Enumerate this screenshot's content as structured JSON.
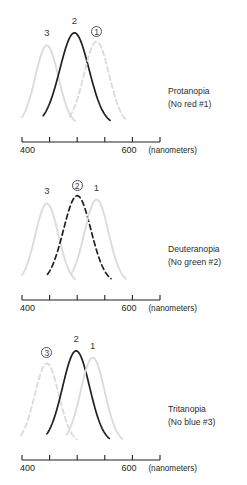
{
  "figure": {
    "background": "#ffffff",
    "dark_color": "#231f20",
    "light_color": "#dcdcdc",
    "mid_color": "#d2d2d2"
  },
  "axis": {
    "label_left": "400",
    "label_right": "600",
    "unit": "(nanometers)",
    "tick_count": 6,
    "x_min_nm": 400,
    "x_max_nm": 650,
    "tick_values_nm": [
      400,
      450,
      500,
      550,
      600,
      650
    ]
  },
  "panels": [
    {
      "id": "protanopia",
      "caption_line1": "Protanopia",
      "caption_line2": "(No red #1)",
      "labels": [
        {
          "text": "3",
          "circled": false
        },
        {
          "text": "2",
          "circled": false
        },
        {
          "text": "1",
          "circled": true
        }
      ]
    },
    {
      "id": "deuteranopia",
      "caption_line1": "Deuteranopia",
      "caption_line2": "(No green #2)",
      "labels": [
        {
          "text": "3",
          "circled": false
        },
        {
          "text": "2",
          "circled": true
        },
        {
          "text": "1",
          "circled": false
        }
      ]
    },
    {
      "id": "tritanopia",
      "caption_line1": "Tritanopia",
      "caption_line2": "(No blue #3)",
      "labels": [
        {
          "text": "3",
          "circled": true
        },
        {
          "text": "2",
          "circled": false
        },
        {
          "text": "1",
          "circled": false
        }
      ]
    }
  ],
  "chart_data": {
    "type": "line",
    "xlabel": "(nanometers)",
    "ylabel": "",
    "xlim": [
      400,
      650
    ],
    "xticks": [
      400,
      450,
      500,
      550,
      600,
      650
    ],
    "xticklabels": [
      "400",
      "",
      "",
      "",
      "600",
      ""
    ],
    "grid": false,
    "legend": "inline curve numbers above peaks",
    "panels": [
      {
        "name": "Protanopia",
        "annotation": "(No red #1)",
        "missing_cone": 1,
        "series": [
          {
            "name": "3",
            "peak_nm": 445,
            "peak_height": 0.82,
            "width_nm": 46,
            "style": "solid",
            "color": "#dcdcdc",
            "emphasis": "faint"
          },
          {
            "name": "2",
            "peak_nm": 495,
            "peak_height": 0.95,
            "width_nm": 58,
            "style": "solid",
            "color": "#231f20",
            "emphasis": "strong"
          },
          {
            "name": "1",
            "peak_nm": 535,
            "peak_height": 0.86,
            "width_nm": 50,
            "style": "dashed",
            "color": "#dcdcdc",
            "emphasis": "faint"
          }
        ]
      },
      {
        "name": "Deuteranopia",
        "annotation": "(No green #2)",
        "missing_cone": 2,
        "series": [
          {
            "name": "3",
            "peak_nm": 445,
            "peak_height": 0.82,
            "width_nm": 46,
            "style": "solid",
            "color": "#dcdcdc",
            "emphasis": "faint"
          },
          {
            "name": "2",
            "peak_nm": 500,
            "peak_height": 0.9,
            "width_nm": 55,
            "style": "dashed",
            "color": "#231f20",
            "emphasis": "strong"
          },
          {
            "name": "1",
            "peak_nm": 535,
            "peak_height": 0.86,
            "width_nm": 48,
            "style": "solid",
            "color": "#dcdcdc",
            "emphasis": "faint"
          }
        ]
      },
      {
        "name": "Tritanopia",
        "annotation": "(No blue #3)",
        "missing_cone": 3,
        "series": [
          {
            "name": "3",
            "peak_nm": 445,
            "peak_height": 0.82,
            "width_nm": 48,
            "style": "dashed",
            "color": "#dcdcdc",
            "emphasis": "faint"
          },
          {
            "name": "2",
            "peak_nm": 498,
            "peak_height": 0.95,
            "width_nm": 54,
            "style": "solid",
            "color": "#231f20",
            "emphasis": "strong"
          },
          {
            "name": "1",
            "peak_nm": 528,
            "peak_height": 0.88,
            "width_nm": 48,
            "style": "solid",
            "color": "#dcdcdc",
            "emphasis": "faint"
          }
        ]
      }
    ]
  }
}
